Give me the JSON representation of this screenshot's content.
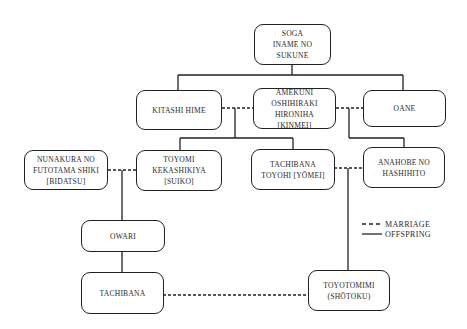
{
  "diagram": {
    "type": "family-tree",
    "nodes": [
      {
        "id": "soga",
        "label": "SOGA\nINAME NO\nSUKUNE"
      },
      {
        "id": "kitashi",
        "label": "KITASHI HIME"
      },
      {
        "id": "kinmei",
        "label": "AMEKUNI\nOSHIHIRAKI\nHIRONIHA\n[KINMEI]"
      },
      {
        "id": "oane",
        "label": "OANE"
      },
      {
        "id": "bidatsu",
        "label": "NUNAKURA NO\nFUTOTAMA SHIKI\n[BIDATSU]"
      },
      {
        "id": "suiko",
        "label": "TOYOMI\nKEKASHIKIYA\n[SUIKO]"
      },
      {
        "id": "yomei",
        "label": "TACHIBANA\nTOYOHI [YŌMEI]"
      },
      {
        "id": "anahobe",
        "label": "ANAHOBE NO\nHASHIHITO"
      },
      {
        "id": "owari",
        "label": "OWARI"
      },
      {
        "id": "tachibana",
        "label": "TACHIBANA"
      },
      {
        "id": "shotoku",
        "label": "TOYOTOMIMI\n(SHŌTOKU)"
      }
    ],
    "edges": [
      {
        "from": "soga",
        "to": "kitashi",
        "type": "offspring"
      },
      {
        "from": "soga",
        "to": "oane",
        "type": "offspring"
      },
      {
        "from": "kitashi",
        "to": "kinmei",
        "type": "marriage"
      },
      {
        "from": "kinmei",
        "to": "oane",
        "type": "marriage"
      },
      {
        "from": "kitashi+kinmei",
        "to": "suiko",
        "type": "offspring"
      },
      {
        "from": "kitashi+kinmei",
        "to": "yomei",
        "type": "offspring"
      },
      {
        "from": "kinmei+oane",
        "to": "anahobe",
        "type": "offspring"
      },
      {
        "from": "bidatsu",
        "to": "suiko",
        "type": "marriage"
      },
      {
        "from": "yomei",
        "to": "anahobe",
        "type": "marriage"
      },
      {
        "from": "bidatsu+suiko",
        "to": "owari",
        "type": "offspring"
      },
      {
        "from": "owari",
        "to": "tachibana",
        "type": "offspring"
      },
      {
        "from": "yomei+anahobe",
        "to": "shotoku",
        "type": "offspring"
      },
      {
        "from": "tachibana",
        "to": "shotoku",
        "type": "marriage"
      }
    ]
  },
  "legend": {
    "marriage": "MARRIAGE",
    "offspring": "OFFSPRING"
  },
  "colors": {
    "line": "#222222",
    "text": "#2a2a2a",
    "background": "#ffffff"
  }
}
